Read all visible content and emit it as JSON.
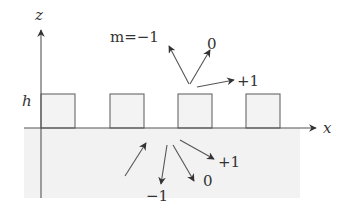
{
  "diagram": {
    "axes": {
      "z_label": "z",
      "x_label": "x",
      "height_label": "h"
    },
    "grating": {
      "tooth_count": 4
    },
    "reflected_orders": {
      "labels": [
        {
          "id": "minus1",
          "text": "m=−1"
        },
        {
          "id": "zero",
          "text": "0"
        },
        {
          "id": "plus1",
          "text": "+1"
        }
      ]
    },
    "transmitted_orders": {
      "labels": [
        {
          "id": "minus1",
          "text": "−1"
        },
        {
          "id": "zero",
          "text": "0"
        },
        {
          "id": "plus1",
          "text": "+1"
        }
      ]
    },
    "incident_beam": {
      "label": ""
    },
    "colors": {
      "line": "#555555",
      "substrate": "#f2f2f2",
      "tooth_fill": "#f3f3f3"
    }
  }
}
